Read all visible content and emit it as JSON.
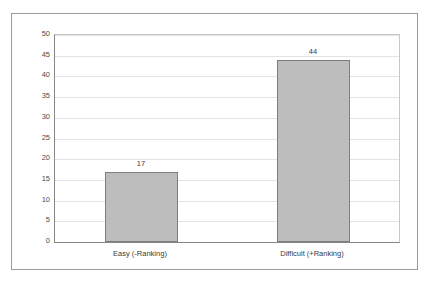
{
  "chart_data": {
    "type": "bar",
    "title": "",
    "subtitle": "",
    "xlabel": "",
    "ylabel": "",
    "categories": [
      "Easy (-Ranking)",
      "Difficult (+Ranking)"
    ],
    "values": [
      17,
      44
    ],
    "data_labels": [
      "17",
      "44"
    ],
    "ylim": [
      0,
      50
    ],
    "ytick_step": 5,
    "ytick_labels": [
      "0",
      "5",
      "10",
      "15",
      "20",
      "25",
      "30",
      "35",
      "40",
      "45",
      "50"
    ],
    "grid": true,
    "grid_axis": "y",
    "legend": false,
    "legend_position": "none",
    "series": [
      {
        "name": "",
        "values": [
          17,
          44
        ]
      }
    ],
    "colors": {
      "bar_fill": "#bdbdbd",
      "bar_border": "#7d7d7d",
      "gridline": "#e3e3e3",
      "axis_line": "#868686",
      "frame_border": "#9a9a9a",
      "plot_background": "#ffffff",
      "text": "#3a3a3a"
    }
  }
}
